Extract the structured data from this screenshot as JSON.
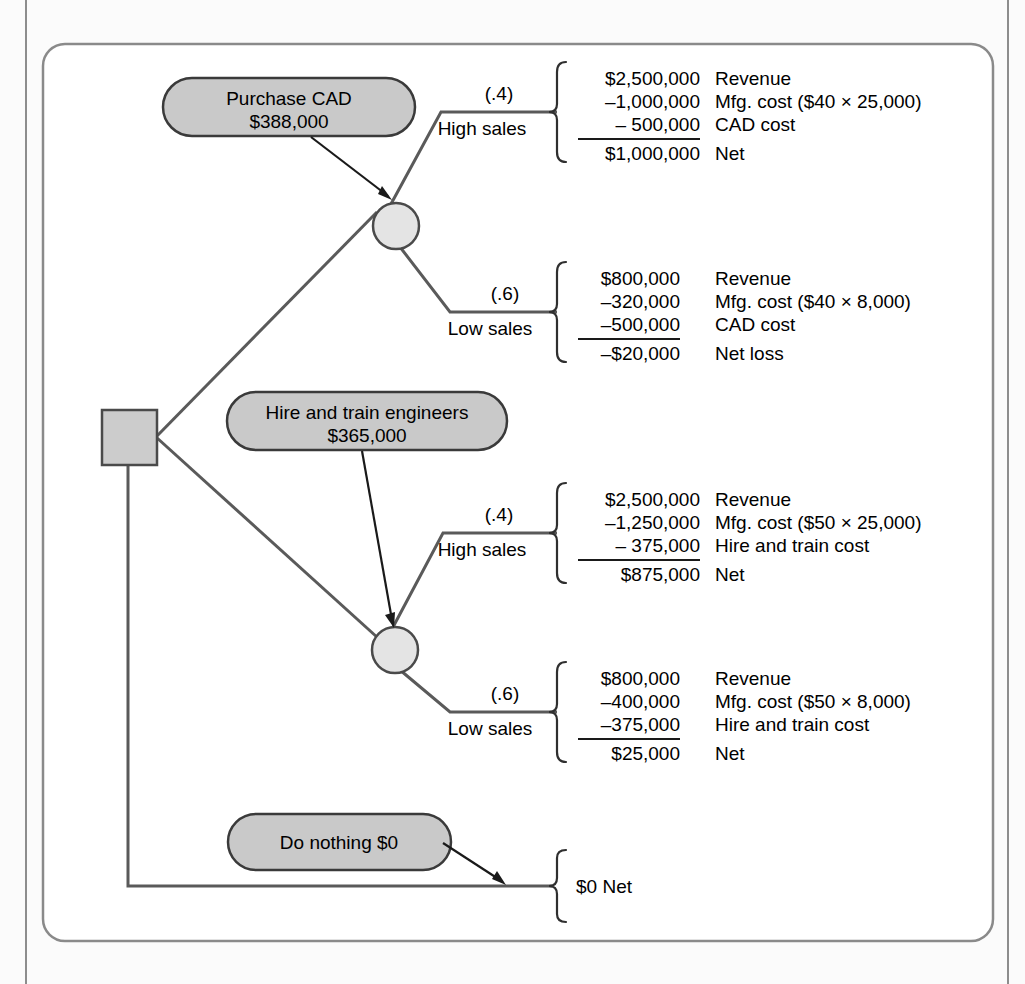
{
  "figure": {
    "type": "decision-tree",
    "background_color": "#fbfbfb",
    "node_fill_color": "#c9c9c9",
    "chance_fill_color": "#e2e2e2",
    "line_color": "#555555",
    "text_color": "#000000"
  },
  "decision_node": {
    "name": "decision-square",
    "label": ""
  },
  "alternatives": [
    {
      "id": "purchase-cad",
      "line1": "Purchase CAD",
      "line2": "$388,000"
    },
    {
      "id": "hire-and-train",
      "line1": "Hire and train engineers",
      "line2": "$365,000"
    },
    {
      "id": "do-nothing",
      "line1": "Do nothing $0",
      "line2": ""
    }
  ],
  "branches": [
    {
      "id": "cad-high-sales",
      "probability": "(.4)",
      "label": "High sales",
      "rows": [
        {
          "amount": "$2,500,000",
          "desc": "Revenue"
        },
        {
          "amount": "–1,000,000",
          "desc": "Mfg. cost ($40 × 25,000)"
        },
        {
          "amount": "–   500,000",
          "desc": "CAD cost"
        },
        {
          "amount": "$1,000,000",
          "desc": "Net"
        }
      ]
    },
    {
      "id": "cad-low-sales",
      "probability": "(.6)",
      "label": "Low sales",
      "rows": [
        {
          "amount": "$800,000",
          "desc": "Revenue"
        },
        {
          "amount": "–320,000",
          "desc": "Mfg. cost ($40 × 8,000)"
        },
        {
          "amount": "–500,000",
          "desc": "CAD cost"
        },
        {
          "amount": "–$20,000",
          "desc": "Net loss"
        }
      ]
    },
    {
      "id": "hire-high-sales",
      "probability": "(.4)",
      "label": "High sales",
      "rows": [
        {
          "amount": "$2,500,000",
          "desc": "Revenue"
        },
        {
          "amount": "–1,250,000",
          "desc": "Mfg. cost ($50 × 25,000)"
        },
        {
          "amount": "–   375,000",
          "desc": "Hire and train cost"
        },
        {
          "amount": "$875,000",
          "desc": "Net"
        }
      ]
    },
    {
      "id": "hire-low-sales",
      "probability": "(.6)",
      "label": "Low sales",
      "rows": [
        {
          "amount": "$800,000",
          "desc": "Revenue"
        },
        {
          "amount": "–400,000",
          "desc": "Mfg. cost ($50 × 8,000)"
        },
        {
          "amount": "–375,000",
          "desc": "Hire and train cost"
        },
        {
          "amount": "$25,000",
          "desc": "Net"
        }
      ]
    },
    {
      "id": "do-nothing-outcome",
      "probability": "",
      "label": "",
      "rows": [
        {
          "amount": "$0 Net",
          "desc": ""
        }
      ]
    }
  ]
}
